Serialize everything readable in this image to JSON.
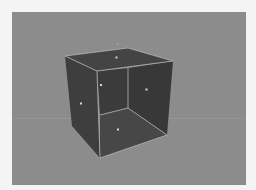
{
  "viewport": {
    "label": "3D viewport",
    "background_color": "#8c8c8c"
  },
  "scene": {
    "object": "cube",
    "view": "perspective, open front face showing interior",
    "face_colors": {
      "top": "#444444",
      "left": "#3e3e3e",
      "right": "#3a3a3a",
      "back": "#3c3c3c",
      "bottom": "#474747"
    },
    "edge_color": "#b8b8b8",
    "face_center_markers": [
      "top",
      "left-inner",
      "left-outer",
      "right",
      "bottom",
      "pivot"
    ]
  }
}
